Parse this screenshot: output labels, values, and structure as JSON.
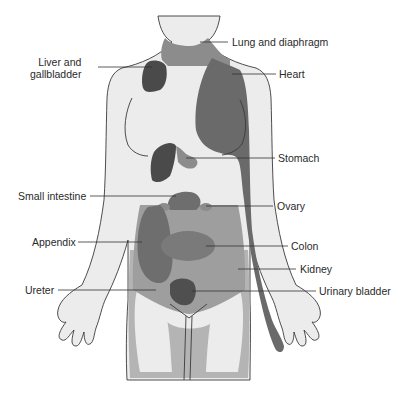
{
  "diagram": {
    "type": "referred-pain-map",
    "colors": {
      "skin": "#ececec",
      "outline": "#3a3a3a",
      "light_region": "#b4b4b4",
      "mid_region": "#8c8c8c",
      "dark_region": "#6e6e6e",
      "darkest_region": "#505050",
      "leader_line": "#333333",
      "text": "#2a2a2a"
    },
    "labels_left": [
      {
        "id": "liver",
        "line1": "Liver and",
        "line2": "gallbladder"
      },
      {
        "id": "small_intestine",
        "text": "Small intestine"
      },
      {
        "id": "appendix",
        "text": "Appendix"
      },
      {
        "id": "ureter",
        "text": "Ureter"
      }
    ],
    "labels_right": [
      {
        "id": "lung",
        "text": "Lung and diaphragm"
      },
      {
        "id": "heart",
        "text": "Heart"
      },
      {
        "id": "stomach",
        "text": "Stomach"
      },
      {
        "id": "ovary",
        "text": "Ovary"
      },
      {
        "id": "colon",
        "text": "Colon"
      },
      {
        "id": "kidney",
        "text": "Kidney"
      },
      {
        "id": "bladder",
        "text": "Urinary bladder"
      }
    ]
  }
}
